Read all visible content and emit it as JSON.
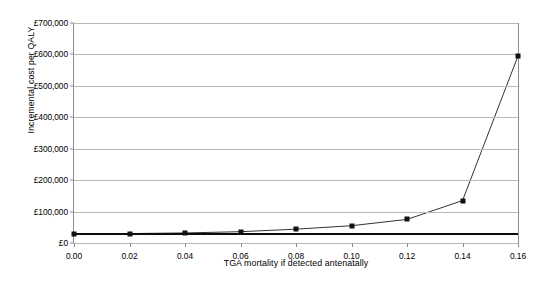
{
  "chart_data": {
    "type": "line",
    "title": "",
    "xlabel": "TGA mortality if detected antenatally",
    "ylabel": "Incremental cost per QALY",
    "x": [
      0.0,
      0.02,
      0.04,
      0.06,
      0.08,
      0.1,
      0.12,
      0.14,
      0.16
    ],
    "values": [
      28000,
      30000,
      32000,
      36000,
      44000,
      55000,
      75000,
      135000,
      595000
    ],
    "series": [
      {
        "name": "Incremental cost per QALY",
        "values": [
          28000,
          30000,
          32000,
          36000,
          44000,
          55000,
          75000,
          135000,
          595000
        ]
      }
    ],
    "xlim": [
      0.0,
      0.16
    ],
    "ylim": [
      0,
      700000
    ],
    "xticks": [
      0.0,
      0.02,
      0.04,
      0.06,
      0.08,
      0.1,
      0.12,
      0.14,
      0.16
    ],
    "xtick_labels": [
      "0.00",
      "0.02",
      "0.04",
      "0.06",
      "0.08",
      "0.10",
      "0.12",
      "0.14",
      "0.16"
    ],
    "yticks": [
      0,
      100000,
      200000,
      300000,
      400000,
      500000,
      600000,
      700000
    ],
    "ytick_labels": [
      "£0",
      "£100,000",
      "£200,000",
      "£300,000",
      "£400,000",
      "£500,000",
      "£600,000",
      "£700,000"
    ],
    "grid": true,
    "legend": "none",
    "annotations": [
      {
        "name": "threshold-line",
        "type": "horizontal-line",
        "value": 30000,
        "label": ""
      }
    ],
    "colors": {
      "series_line": "#333333",
      "marker": "#111111",
      "gridline": "#b9b9b9",
      "axis": "#8d8d8d",
      "threshold": "#0d0d0d",
      "background": "#ffffff",
      "text": "#000000"
    }
  },
  "caption": {
    "text": ""
  }
}
